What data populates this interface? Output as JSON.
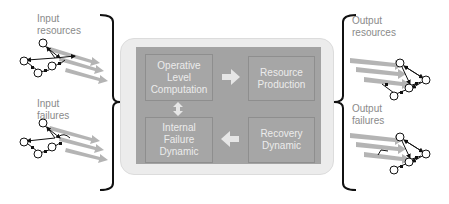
{
  "left": {
    "input_resources_label": "Input\nresources",
    "input_failures_label": "Input\nfailures"
  },
  "right": {
    "output_resources_label": "Output\nresources",
    "output_failures_label": "Output\nfailures"
  },
  "center": {
    "blocks": [
      {
        "label": "Operative\nLevel\nComputation"
      },
      {
        "label": "Resource\nProduction"
      },
      {
        "label": "Internal\nFailure\nDynamic"
      },
      {
        "label": "Recovery\nDynamic"
      }
    ],
    "arrows": [
      {
        "from": "Operative Level Computation",
        "to": "Resource Production",
        "direction": "right"
      },
      {
        "from": "Operative Level Computation",
        "to": "Internal Failure Dynamic",
        "direction": "bidirectional-vertical"
      },
      {
        "from": "Recovery Dynamic",
        "to": "Internal Failure Dynamic",
        "direction": "left"
      }
    ]
  },
  "colors": {
    "outer_fill": "#ececec",
    "inner_fill": "#a3a3a3",
    "block_text": "#ececec",
    "arrow_fill": "#e6e6e6",
    "label_text": "#8a8a8a",
    "brace": "#111111",
    "flow_arrow": "#a8a8a8"
  }
}
